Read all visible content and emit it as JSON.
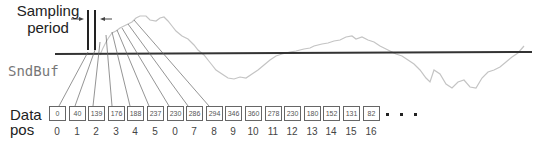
{
  "labels": {
    "sampling_line1": "Sampling",
    "sampling_line2": "period",
    "sndbuf": "SndBuf",
    "data_line1": "Data",
    "data_line2": "pos"
  },
  "buffer": {
    "values": [
      "0",
      "40",
      "139",
      "176",
      "188",
      "237",
      "230",
      "286",
      "294",
      "346",
      "360",
      "278",
      "230",
      "180",
      "152",
      "131",
      "82"
    ],
    "indices": [
      "0",
      "1",
      "2",
      "3",
      "4",
      "5",
      "0",
      "7",
      "8",
      "9",
      "10",
      "11",
      "12",
      "13",
      "14",
      "15",
      "16"
    ],
    "ellipsis": "..."
  },
  "colors": {
    "waveform": "#c8c8c8",
    "axis": "#333333",
    "connector": "#555555",
    "box_border": "#666666"
  }
}
